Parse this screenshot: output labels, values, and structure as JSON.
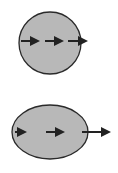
{
  "colors": {
    "fill": "#b8b8b8",
    "stroke": "#2a2a2a",
    "arrow": "#222222",
    "background": "#ffffff"
  },
  "shapes": [
    {
      "name": "circle-shape",
      "type": "circle",
      "cx": 50,
      "cy": 43,
      "rx": 31,
      "ry": 31,
      "arrows": [
        {
          "x1": 21,
          "x2": 38,
          "y": 41
        },
        {
          "x1": 45,
          "x2": 62,
          "y": 41
        },
        {
          "x1": 68,
          "x2": 86,
          "y": 41
        }
      ]
    },
    {
      "name": "ellipse-shape",
      "type": "ellipse",
      "cx": 50,
      "cy": 132,
      "rx": 38,
      "ry": 27,
      "arrows": [
        {
          "x1": 15,
          "x2": 25,
          "y": 132
        },
        {
          "x1": 46,
          "x2": 63,
          "y": 132
        },
        {
          "x1": 82,
          "x2": 109,
          "y": 132
        }
      ]
    }
  ]
}
